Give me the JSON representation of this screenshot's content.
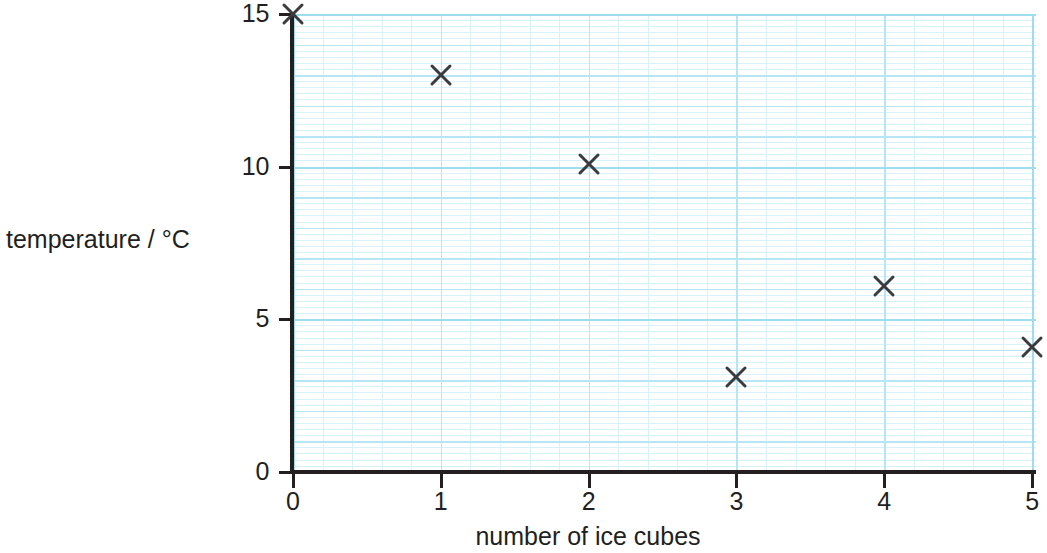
{
  "chart_data": {
    "type": "scatter",
    "title": "",
    "xlabel": "number of ice cubes",
    "ylabel": "temperature / °C",
    "xlim": [
      0,
      5
    ],
    "ylim": [
      0,
      15
    ],
    "grid": true,
    "grid_style": "graph paper, minor 0.2 units, major 1 unit, heavy 5 units",
    "legend": "none",
    "marker": "x",
    "marker_color": "#3b3b3f",
    "grid_color_minor": "#d8f2f9",
    "grid_color_major": "#b6e6f3",
    "grid_color_heavy": "#9dddee",
    "axis_color": "#231f20",
    "xticks": [
      "0",
      "1",
      "2",
      "3",
      "4",
      "5"
    ],
    "yticks": [
      "0",
      "5",
      "10",
      "15"
    ],
    "xtick_values": [
      0,
      1,
      2,
      3,
      4,
      5
    ],
    "ytick_values": [
      0,
      5,
      10,
      15
    ],
    "x": [
      0,
      1,
      2,
      3,
      4,
      5
    ],
    "y": [
      15.0,
      13.0,
      10.1,
      3.1,
      6.1,
      4.1
    ],
    "points": [
      {
        "x": 0,
        "y": 15.0
      },
      {
        "x": 1,
        "y": 13.0
      },
      {
        "x": 2,
        "y": 10.1
      },
      {
        "x": 3,
        "y": 3.1
      },
      {
        "x": 4,
        "y": 6.1
      },
      {
        "x": 5,
        "y": 4.1
      }
    ]
  }
}
